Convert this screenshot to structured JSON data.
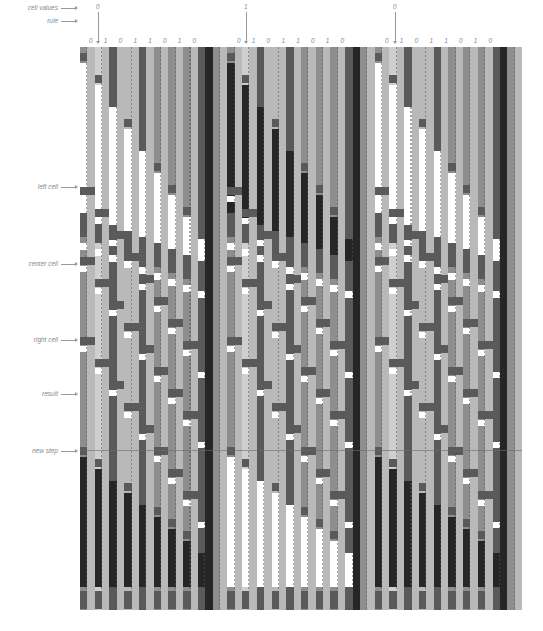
{
  "labels": {
    "cell_values": "cell values",
    "rule": "rule",
    "left_cell": "left cell",
    "center_cell": "center cell",
    "right_cell": "right cell",
    "result": "result",
    "new_step": "new step"
  },
  "label_positions": {
    "cell_values": 7,
    "rule": 20,
    "left_cell": 186,
    "center_cell": 263,
    "right_cell": 339,
    "result": 393,
    "new_step": 450
  },
  "cell_values": [
    {
      "value": "0",
      "x": 96
    },
    {
      "value": "1",
      "x": 244
    },
    {
      "value": "0",
      "x": 393
    }
  ],
  "rule_digits": [
    "0",
    "1",
    "0",
    "1",
    "1",
    "0",
    "1",
    "0"
  ],
  "rule_blocks": [
    {
      "x": 89,
      "spacing": 14.8
    },
    {
      "x": 237,
      "spacing": 14.8
    },
    {
      "x": 385,
      "spacing": 14.8
    }
  ],
  "grid": {
    "left": 80,
    "top": 47,
    "width": 442,
    "height": 563,
    "blocks": 3,
    "cols_per_block": 20,
    "divider_y": 403,
    "colors": {
      "white": "#ffffff",
      "light": "#b9b9b9",
      "mid": "#8e8e8e",
      "dark": "#5a5a5a",
      "black": "#262626",
      "pale": "#cfcfcf"
    },
    "block_values": [
      0,
      1,
      0
    ],
    "column_shades": [
      "mid",
      "dark",
      "pale",
      "mid",
      "dark",
      "mid",
      "light",
      "mid",
      "dark",
      "mid",
      "mid",
      "mid",
      "mid",
      "dark",
      "mid",
      "mid",
      "dark",
      "black",
      "mid",
      "light"
    ]
  }
}
